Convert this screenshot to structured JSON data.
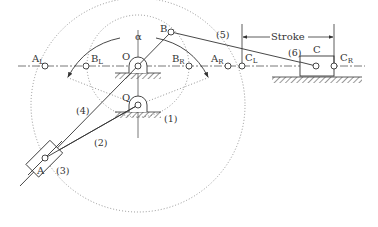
{
  "diagram": {
    "type": "quick-return mechanism (Whitworth / crank and slotted lever)",
    "colors": {
      "line": "#333333",
      "dotted": "#888888",
      "background": "#ffffff"
    },
    "labels": {
      "alpha": "α",
      "O": "O",
      "Q": "Q",
      "A": "A",
      "B": "B",
      "C": "C",
      "A_L": "A",
      "A_L_sub": "L",
      "B_L": "B",
      "B_L_sub": "L",
      "B_R": "B",
      "B_R_sub": "R",
      "A_R": "A",
      "A_R_sub": "R",
      "C_L": "C",
      "C_L_sub": "L",
      "C_R": "C",
      "C_R_sub": "R",
      "stroke": "Stroke"
    },
    "links": {
      "l1": "(1)",
      "l2": "(2)",
      "l3": "(3)",
      "l4": "(4)",
      "l5": "(5)",
      "l6": "(6)"
    }
  }
}
